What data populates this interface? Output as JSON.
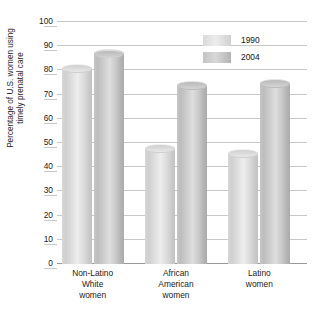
{
  "chart_data": {
    "type": "bar",
    "title": "",
    "xlabel": "",
    "ylabel": "Percentage of U.S. women using\ntimely prenatal care",
    "ylim": [
      0,
      100
    ],
    "ytick_step": 10,
    "yticks": [
      "100",
      "90",
      "80",
      "70",
      "60",
      "50",
      "40",
      "30",
      "20",
      "10",
      "0"
    ],
    "grid": true,
    "legend_position": "top-right",
    "categories": [
      "Non-Latino\nWhite\nwomen",
      "African\nAmerican\nwomen",
      "Latino\nwomen"
    ],
    "series": [
      {
        "name": "1990",
        "color": "#dcdcdc",
        "values": [
          81,
          48,
          46
        ]
      },
      {
        "name": "2004",
        "color": "#c3c3c3",
        "values": [
          87,
          74,
          75
        ]
      }
    ]
  },
  "legend": {
    "items": [
      {
        "label": "1990"
      },
      {
        "label": "2004"
      }
    ]
  },
  "axis": {
    "y_title": "Percentage of U.S. women using\ntimely prenatal care"
  }
}
